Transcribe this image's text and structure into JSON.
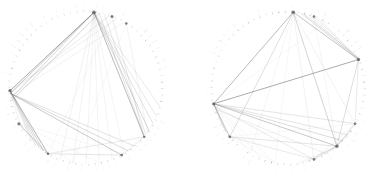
{
  "figure": {
    "title": "",
    "background": "#ffffff",
    "panel_count": 2,
    "edge_color": "#7c7c7c",
    "node_color": "#8a8a8a",
    "hub_color": "#5d5d5d",
    "label_color": "#6a6a6a"
  },
  "chart_data": {
    "type": "scatter",
    "title": "",
    "subtitle": "",
    "xlabel": "",
    "ylabel": "",
    "grid": false,
    "legend_position": "none",
    "panels": [
      {
        "name": "left-network",
        "center": [
          86,
          88
        ],
        "radius": 76,
        "node_count": 74,
        "label_start_angle_deg": -92,
        "hub_nodes": [
          {
            "angle_deg": -84,
            "size": 1.9
          },
          {
            "angle_deg": -70,
            "size": 1.5
          },
          {
            "angle_deg": -58,
            "size": 1.3
          },
          {
            "angle_deg": 178,
            "size": 1.7
          },
          {
            "angle_deg": 152,
            "size": 1.5
          },
          {
            "angle_deg": 120,
            "size": 1.3
          },
          {
            "angle_deg": 62,
            "size": 1.4
          },
          {
            "angle_deg": 40,
            "size": 1.2
          }
        ],
        "edges": [
          {
            "a": -84,
            "b": 178,
            "w": 0.75,
            "o": 0.85
          },
          {
            "a": -84,
            "b": 176,
            "w": 0.6,
            "o": 0.7
          },
          {
            "a": -84,
            "b": 172,
            "w": 0.55,
            "o": 0.6
          },
          {
            "a": -84,
            "b": 40,
            "w": 0.65,
            "o": 0.8
          },
          {
            "a": -84,
            "b": 34,
            "w": 0.5,
            "o": 0.6
          },
          {
            "a": -84,
            "b": 28,
            "w": 0.45,
            "o": 0.5
          },
          {
            "a": -84,
            "b": 22,
            "w": 0.4,
            "o": 0.45
          },
          {
            "a": -84,
            "b": 14,
            "w": 0.4,
            "o": 0.4
          },
          {
            "a": -80,
            "b": 170,
            "w": 0.5,
            "o": 0.6
          },
          {
            "a": -80,
            "b": 40,
            "w": 0.45,
            "o": 0.5
          },
          {
            "a": -76,
            "b": 38,
            "w": 0.4,
            "o": 0.45
          },
          {
            "a": -72,
            "b": 176,
            "w": 0.4,
            "o": 0.4
          },
          {
            "a": -70,
            "b": 40,
            "w": 0.4,
            "o": 0.4
          },
          {
            "a": -66,
            "b": 178,
            "w": 0.35,
            "o": 0.35
          },
          {
            "a": -60,
            "b": 174,
            "w": 0.35,
            "o": 0.3
          },
          {
            "a": -58,
            "b": 36,
            "w": 0.35,
            "o": 0.3
          },
          {
            "a": 178,
            "b": 120,
            "w": 0.7,
            "o": 0.8
          },
          {
            "a": 178,
            "b": 124,
            "w": 0.55,
            "o": 0.6
          },
          {
            "a": 178,
            "b": 128,
            "w": 0.5,
            "o": 0.5
          },
          {
            "a": 178,
            "b": 132,
            "w": 0.45,
            "o": 0.45
          },
          {
            "a": 178,
            "b": 136,
            "w": 0.4,
            "o": 0.4
          },
          {
            "a": 176,
            "b": 62,
            "w": 0.6,
            "o": 0.7
          },
          {
            "a": 176,
            "b": 56,
            "w": 0.5,
            "o": 0.55
          },
          {
            "a": 176,
            "b": 50,
            "w": 0.45,
            "o": 0.5
          },
          {
            "a": 152,
            "b": 120,
            "w": 0.5,
            "o": 0.55
          },
          {
            "a": 152,
            "b": 124,
            "w": 0.4,
            "o": 0.4
          },
          {
            "a": 120,
            "b": 62,
            "w": 0.45,
            "o": 0.45
          },
          {
            "a": 120,
            "b": 40,
            "w": 0.4,
            "o": 0.4
          },
          {
            "a": 62,
            "b": 40,
            "w": 0.4,
            "o": 0.4
          },
          {
            "a": -84,
            "b": 110,
            "w": 0.35,
            "o": 0.3
          },
          {
            "a": -84,
            "b": 100,
            "w": 0.35,
            "o": 0.28
          },
          {
            "a": -84,
            "b": 90,
            "w": 0.35,
            "o": 0.25
          },
          {
            "a": -84,
            "b": 80,
            "w": 0.35,
            "o": 0.25
          },
          {
            "a": -84,
            "b": 70,
            "w": 0.35,
            "o": 0.25
          },
          {
            "a": -84,
            "b": 60,
            "w": 0.35,
            "o": 0.25
          },
          {
            "a": 178,
            "b": 150,
            "w": 0.3,
            "o": 0.25
          },
          {
            "a": 178,
            "b": 146,
            "w": 0.3,
            "o": 0.22
          },
          {
            "a": 152,
            "b": 100,
            "w": 0.3,
            "o": 0.22
          },
          {
            "a": 152,
            "b": 80,
            "w": 0.3,
            "o": 0.2
          },
          {
            "a": 152,
            "b": 60,
            "w": 0.3,
            "o": 0.2
          },
          {
            "a": -70,
            "b": 120,
            "w": 0.3,
            "o": 0.2
          },
          {
            "a": -58,
            "b": 100,
            "w": 0.3,
            "o": 0.2
          }
        ],
        "labels": [
          "",
          "",
          "",
          "",
          "",
          "",
          "",
          "",
          "",
          "",
          "",
          "",
          "",
          "",
          "",
          "",
          "",
          "",
          "",
          "",
          "",
          "",
          "",
          "",
          "",
          "",
          "",
          "",
          "",
          "",
          "",
          "",
          "",
          "",
          "",
          "",
          "",
          "",
          "",
          "",
          "",
          "",
          "",
          "",
          "",
          "",
          "",
          "",
          "",
          "",
          "",
          "",
          "",
          "",
          "",
          "",
          "",
          "",
          "",
          "",
          "",
          "",
          "",
          "",
          "",
          "",
          "",
          "",
          "",
          "",
          "",
          "",
          "",
          ""
        ]
      },
      {
        "name": "right-network",
        "center": [
          99,
          88
        ],
        "radius": 76,
        "node_count": 74,
        "label_start_angle_deg": -92,
        "hub_nodes": [
          {
            "angle_deg": -86,
            "size": 1.8
          },
          {
            "angle_deg": -70,
            "size": 1.3
          },
          {
            "angle_deg": -22,
            "size": 1.7
          },
          {
            "angle_deg": 168,
            "size": 1.6
          },
          {
            "angle_deg": 140,
            "size": 1.4
          },
          {
            "angle_deg": 50,
            "size": 1.7
          },
          {
            "angle_deg": 70,
            "size": 1.3
          },
          {
            "angle_deg": 28,
            "size": 1.3
          }
        ],
        "edges": [
          {
            "a": -86,
            "b": 168,
            "w": 0.7,
            "o": 0.75
          },
          {
            "a": -86,
            "b": -22,
            "w": 0.65,
            "o": 0.7
          },
          {
            "a": -86,
            "b": 50,
            "w": 0.55,
            "o": 0.6
          },
          {
            "a": -86,
            "b": 140,
            "w": 0.5,
            "o": 0.5
          },
          {
            "a": -80,
            "b": -22,
            "w": 0.5,
            "o": 0.55
          },
          {
            "a": -78,
            "b": -24,
            "w": 0.45,
            "o": 0.5
          },
          {
            "a": -74,
            "b": -22,
            "w": 0.4,
            "o": 0.45
          },
          {
            "a": -70,
            "b": -24,
            "w": 0.4,
            "o": 0.4
          },
          {
            "a": -66,
            "b": -22,
            "w": 0.35,
            "o": 0.35
          },
          {
            "a": 168,
            "b": -22,
            "w": 0.75,
            "o": 0.85
          },
          {
            "a": 168,
            "b": 140,
            "w": 0.6,
            "o": 0.65
          },
          {
            "a": 168,
            "b": 144,
            "w": 0.5,
            "o": 0.5
          },
          {
            "a": 168,
            "b": 148,
            "w": 0.45,
            "o": 0.45
          },
          {
            "a": 168,
            "b": 50,
            "w": 0.6,
            "o": 0.7
          },
          {
            "a": 168,
            "b": 44,
            "w": 0.5,
            "o": 0.55
          },
          {
            "a": 168,
            "b": 38,
            "w": 0.45,
            "o": 0.45
          },
          {
            "a": 168,
            "b": 28,
            "w": 0.45,
            "o": 0.45
          },
          {
            "a": 166,
            "b": 70,
            "w": 0.4,
            "o": 0.4
          },
          {
            "a": 164,
            "b": 60,
            "w": 0.4,
            "o": 0.35
          },
          {
            "a": 140,
            "b": 50,
            "w": 0.45,
            "o": 0.45
          },
          {
            "a": 140,
            "b": 70,
            "w": 0.4,
            "o": 0.4
          },
          {
            "a": 50,
            "b": 28,
            "w": 0.5,
            "o": 0.5
          },
          {
            "a": 50,
            "b": 34,
            "w": 0.4,
            "o": 0.4
          },
          {
            "a": 50,
            "b": 70,
            "w": 0.45,
            "o": 0.45
          },
          {
            "a": 50,
            "b": 76,
            "w": 0.4,
            "o": 0.4
          },
          {
            "a": 50,
            "b": 82,
            "w": 0.35,
            "o": 0.35
          },
          {
            "a": -22,
            "b": 50,
            "w": 0.5,
            "o": 0.5
          },
          {
            "a": -22,
            "b": 28,
            "w": 0.4,
            "o": 0.4
          },
          {
            "a": 168,
            "b": 100,
            "w": 0.3,
            "o": 0.25
          },
          {
            "a": 168,
            "b": 110,
            "w": 0.3,
            "o": 0.22
          },
          {
            "a": 168,
            "b": 120,
            "w": 0.3,
            "o": 0.22
          },
          {
            "a": -86,
            "b": 120,
            "w": 0.3,
            "o": 0.25
          },
          {
            "a": -86,
            "b": 100,
            "w": 0.3,
            "o": 0.22
          },
          {
            "a": -86,
            "b": 70,
            "w": 0.35,
            "o": 0.3
          },
          {
            "a": -86,
            "b": 28,
            "w": 0.35,
            "o": 0.3
          },
          {
            "a": 140,
            "b": 100,
            "w": 0.3,
            "o": 0.2
          },
          {
            "a": 140,
            "b": 28,
            "w": 0.3,
            "o": 0.22
          },
          {
            "a": 70,
            "b": 28,
            "w": 0.35,
            "o": 0.3
          },
          {
            "a": -70,
            "b": 50,
            "w": 0.3,
            "o": 0.25
          },
          {
            "a": -60,
            "b": 168,
            "w": 0.3,
            "o": 0.22
          },
          {
            "a": 60,
            "b": 50,
            "w": 0.3,
            "o": 0.25
          },
          {
            "a": 40,
            "b": 50,
            "w": 0.3,
            "o": 0.25
          }
        ],
        "labels": [
          "",
          "",
          "",
          "",
          "",
          "",
          "",
          "",
          "",
          "",
          "",
          "",
          "",
          "",
          "",
          "",
          "",
          "",
          "",
          "",
          "",
          "",
          "",
          "",
          "",
          "",
          "",
          "",
          "",
          "",
          "",
          "",
          "",
          "",
          "",
          "",
          "",
          "",
          "",
          "",
          "",
          "",
          "",
          "",
          "",
          "",
          "",
          "",
          "",
          "",
          "",
          "",
          "",
          "",
          "",
          "",
          "",
          "",
          "",
          "",
          "",
          "",
          "",
          "",
          "",
          "",
          "",
          "",
          "",
          "",
          "",
          "",
          "",
          ""
        ]
      }
    ]
  }
}
